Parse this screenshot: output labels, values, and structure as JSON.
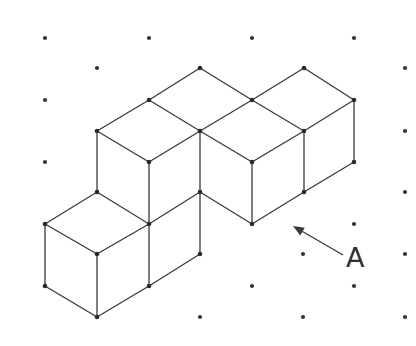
{
  "figure": {
    "title": "",
    "colors": {
      "line": "#3a3a3a",
      "dot": "#333333",
      "background": "#ffffff"
    },
    "grid_dots": [
      [
        45,
        38
      ],
      [
        149,
        38
      ],
      [
        252,
        38
      ],
      [
        354,
        38
      ],
      [
        97,
        68
      ],
      [
        405,
        68
      ],
      [
        45,
        100
      ],
      [
        405,
        131
      ],
      [
        45,
        162
      ],
      [
        405,
        192
      ],
      [
        354,
        224
      ],
      [
        303,
        254
      ],
      [
        405,
        254
      ],
      [
        200,
        317
      ],
      [
        252,
        286
      ],
      [
        354,
        286
      ],
      [
        303,
        317
      ],
      [
        405,
        317
      ]
    ],
    "vertices": [
      [
        200,
        68
      ],
      [
        304,
        68
      ],
      [
        149,
        100
      ],
      [
        252,
        100
      ],
      [
        354,
        100
      ],
      [
        97,
        131
      ],
      [
        200,
        131
      ],
      [
        304,
        131
      ],
      [
        149,
        162
      ],
      [
        252,
        162
      ],
      [
        354,
        162
      ],
      [
        97,
        192
      ],
      [
        200,
        192
      ],
      [
        304,
        192
      ],
      [
        45,
        224
      ],
      [
        149,
        224
      ],
      [
        252,
        224
      ],
      [
        97,
        254
      ],
      [
        200,
        254
      ],
      [
        45,
        286
      ],
      [
        149,
        286
      ],
      [
        97,
        317
      ]
    ],
    "edges": [
      [
        [
          200,
          68
        ],
        [
          252,
          100
        ]
      ],
      [
        [
          200,
          68
        ],
        [
          149,
          100
        ]
      ],
      [
        [
          149,
          100
        ],
        [
          97,
          131
        ]
      ],
      [
        [
          149,
          100
        ],
        [
          200,
          131
        ]
      ],
      [
        [
          97,
          131
        ],
        [
          149,
          162
        ]
      ],
      [
        [
          200,
          131
        ],
        [
          149,
          162
        ]
      ],
      [
        [
          252,
          100
        ],
        [
          200,
          131
        ]
      ],
      [
        [
          252,
          100
        ],
        [
          304,
          68
        ]
      ],
      [
        [
          252,
          100
        ],
        [
          304,
          131
        ]
      ],
      [
        [
          200,
          131
        ],
        [
          252,
          162
        ]
      ],
      [
        [
          304,
          131
        ],
        [
          252,
          162
        ]
      ],
      [
        [
          304,
          68
        ],
        [
          354,
          100
        ]
      ],
      [
        [
          354,
          100
        ],
        [
          304,
          131
        ]
      ],
      [
        [
          97,
          131
        ],
        [
          97,
          192
        ]
      ],
      [
        [
          149,
          162
        ],
        [
          149,
          286
        ]
      ],
      [
        [
          200,
          131
        ],
        [
          200,
          254
        ]
      ],
      [
        [
          252,
          162
        ],
        [
          252,
          224
        ]
      ],
      [
        [
          304,
          131
        ],
        [
          304,
          192
        ]
      ],
      [
        [
          354,
          100
        ],
        [
          354,
          162
        ]
      ],
      [
        [
          200,
          192
        ],
        [
          149,
          224
        ]
      ],
      [
        [
          200,
          192
        ],
        [
          252,
          224
        ]
      ],
      [
        [
          97,
          192
        ],
        [
          45,
          224
        ]
      ],
      [
        [
          97,
          192
        ],
        [
          149,
          224
        ]
      ],
      [
        [
          45,
          224
        ],
        [
          97,
          254
        ]
      ],
      [
        [
          149,
          224
        ],
        [
          97,
          254
        ]
      ],
      [
        [
          45,
          224
        ],
        [
          45,
          286
        ]
      ],
      [
        [
          97,
          254
        ],
        [
          97,
          317
        ]
      ],
      [
        [
          45,
          286
        ],
        [
          97,
          317
        ]
      ],
      [
        [
          97,
          317
        ],
        [
          149,
          286
        ]
      ],
      [
        [
          149,
          286
        ],
        [
          200,
          254
        ]
      ],
      [
        [
          252,
          224
        ],
        [
          304,
          192
        ]
      ],
      [
        [
          304,
          192
        ],
        [
          354,
          162
        ]
      ]
    ],
    "arrow": {
      "from": [
        343,
        255
      ],
      "to": [
        293,
        226
      ],
      "label": "A"
    }
  }
}
